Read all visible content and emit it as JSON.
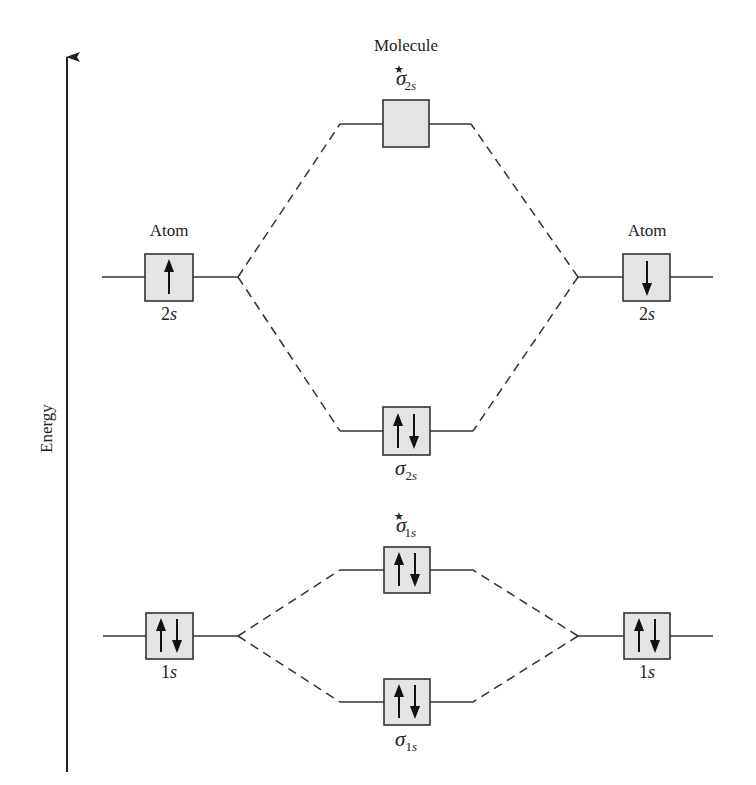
{
  "diagram": {
    "axis": {
      "label": "Energy",
      "direction": "up"
    },
    "header_label": "Molecule",
    "left_atom_label": "Atom",
    "right_atom_label": "Atom",
    "colors": {
      "box_fill": "#e4e4e4",
      "line": "#333333",
      "background": "#ffffff"
    },
    "levels": {
      "sigma_2s_star": {
        "symbol": "σ",
        "sub_num": "2",
        "sub_letter": "s",
        "star": "★",
        "electrons": ""
      },
      "atom_left_2s": {
        "num": "2",
        "letter": "s",
        "electrons": "↑"
      },
      "atom_right_2s": {
        "num": "2",
        "letter": "s",
        "electrons": "↓"
      },
      "sigma_2s": {
        "symbol": "σ",
        "sub_num": "2",
        "sub_letter": "s",
        "electrons": "↑↓"
      },
      "sigma_1s_star": {
        "symbol": "σ",
        "sub_num": "1",
        "sub_letter": "s",
        "star": "★",
        "electrons": "↑↓"
      },
      "atom_left_1s": {
        "num": "1",
        "letter": "s",
        "electrons": "↑↓"
      },
      "atom_right_1s": {
        "num": "1",
        "letter": "s",
        "electrons": "↑↓"
      },
      "sigma_1s": {
        "symbol": "σ",
        "sub_num": "1",
        "sub_letter": "s",
        "electrons": "↑↓"
      }
    }
  }
}
